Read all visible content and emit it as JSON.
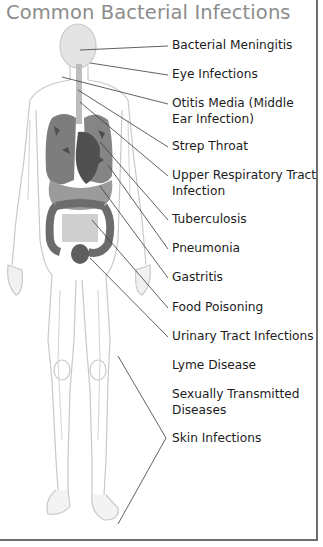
{
  "title": "Common Bacterial Infections",
  "colors": {
    "title": "#8c8c8c",
    "label": "#1c1c1c",
    "leader_line": "#333333",
    "frame": "#6e6e6e",
    "organ_dark": "#5a5a5a",
    "organ_mid": "#8a8a8a",
    "body_outline": "#c8c8c8"
  },
  "labels": [
    {
      "text": "Bacterial Meningitis",
      "top": 38
    },
    {
      "text": "Eye Infections",
      "top": 67
    },
    {
      "text": "Otitis Media (Middle Ear Infection)",
      "top": 96
    },
    {
      "text": "Strep Throat",
      "top": 139
    },
    {
      "text": "Upper Respiratory Tract Infection",
      "top": 168
    },
    {
      "text": "Tuberculosis",
      "top": 212
    },
    {
      "text": "Pneumonia",
      "top": 241
    },
    {
      "text": "Gastritis",
      "top": 270
    },
    {
      "text": "Food Poisoning",
      "top": 300
    },
    {
      "text": "Urinary Tract Infections",
      "top": 329
    },
    {
      "text": "Lyme Disease",
      "top": 358
    },
    {
      "text": "Sexually Transmitted Diseases",
      "top": 387
    },
    {
      "text": "Skin Infections",
      "top": 431
    }
  ]
}
